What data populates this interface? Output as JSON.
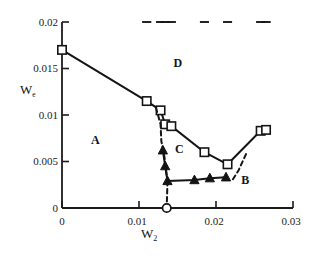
{
  "chart_data": {
    "type": "line",
    "title": "",
    "subtitle": "",
    "xlabel": "W2",
    "xlabel_display": "W",
    "xlabel_sub": "2",
    "ylabel": "We",
    "ylabel_display": "W",
    "ylabel_sub": "e",
    "xlim": [
      0,
      0.03
    ],
    "ylim": [
      0,
      0.02
    ],
    "xticks": [
      0,
      0.01,
      0.02,
      0.03
    ],
    "xtick_labels": [
      "0",
      "0.01",
      "0.02",
      "0.03"
    ],
    "yticks": [
      0,
      0.005,
      0.01,
      0.015,
      0.02
    ],
    "ytick_labels": [
      "0",
      "0.005",
      "0.01",
      "0.015",
      "0.02"
    ],
    "grid": false,
    "legend": "none",
    "series": [
      {
        "name": "upper-boundary-squares",
        "marker": "open-square",
        "line": "solid",
        "points": [
          {
            "x": 0.0,
            "y": 0.017,
            "yerr": 0.0
          },
          {
            "x": 0.011,
            "y": 0.0115,
            "yerr": 0.0014
          },
          {
            "x": 0.0128,
            "y": 0.0105,
            "yerr": 0.0017
          },
          {
            "x": 0.0134,
            "y": 0.009,
            "yerr": 0.0013
          },
          {
            "x": 0.0142,
            "y": 0.0088,
            "yerr": 0.0016
          },
          {
            "x": 0.0185,
            "y": 0.006,
            "yerr": 0.0016
          },
          {
            "x": 0.0215,
            "y": 0.0047,
            "yerr": 0.0013
          },
          {
            "x": 0.0258,
            "y": 0.0083,
            "yerr": 0.0015
          },
          {
            "x": 0.0265,
            "y": 0.0084,
            "yerr": 0.0016
          }
        ]
      },
      {
        "name": "lower-boundary-triangles",
        "marker": "filled-triangle",
        "line": "solid",
        "points": [
          {
            "x": 0.0131,
            "y": 0.0062,
            "yerr": 0.0
          },
          {
            "x": 0.0134,
            "y": 0.0045,
            "yerr": 0.0
          },
          {
            "x": 0.0137,
            "y": 0.0029,
            "yerr": 0.0
          },
          {
            "x": 0.0172,
            "y": 0.003,
            "yerr": 0.0
          },
          {
            "x": 0.0192,
            "y": 0.0032,
            "yerr": 0.0
          },
          {
            "x": 0.0213,
            "y": 0.0033,
            "yerr": 0.0
          }
        ]
      },
      {
        "name": "dashed-guide-left",
        "marker": "none",
        "line": "dashed",
        "points": [
          {
            "x": 0.0122,
            "y": 0.0108
          },
          {
            "x": 0.0128,
            "y": 0.009
          },
          {
            "x": 0.0129,
            "y": 0.0072
          },
          {
            "x": 0.0133,
            "y": 0.0055
          },
          {
            "x": 0.0137,
            "y": 0.0029
          }
        ]
      },
      {
        "name": "dashed-guide-vertical",
        "marker": "none",
        "line": "dashed",
        "points": [
          {
            "x": 0.0137,
            "y": 0.0029
          },
          {
            "x": 0.0136,
            "y": 0.0
          }
        ]
      },
      {
        "name": "dashed-guide-right",
        "marker": "none",
        "line": "dashed",
        "points": [
          {
            "x": 0.0239,
            "y": 0.0058
          },
          {
            "x": 0.0229,
            "y": 0.004
          },
          {
            "x": 0.0222,
            "y": 0.0031
          }
        ]
      },
      {
        "name": "axis-critical-point",
        "marker": "open-circle",
        "line": "none",
        "points": [
          {
            "x": 0.0136,
            "y": 0.0
          }
        ]
      }
    ],
    "region_labels": [
      {
        "label": "A",
        "x": 0.0043,
        "y": 0.0072
      },
      {
        "label": "B",
        "x": 0.0238,
        "y": 0.0029
      },
      {
        "label": "C",
        "x": 0.0152,
        "y": 0.0062
      },
      {
        "label": "D",
        "x": 0.015,
        "y": 0.0155
      }
    ]
  },
  "colors": {
    "axis": "#1b1b1b",
    "data_line": "#141414",
    "marker_fill": "#ffffff",
    "marker_stroke": "#141414",
    "triangle_fill": "#141414",
    "background": "#ffffff"
  }
}
